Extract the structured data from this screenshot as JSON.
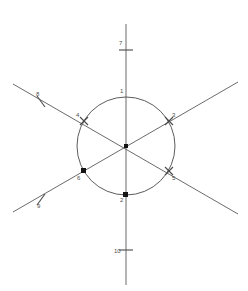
{
  "figure": {
    "kind": "geometry-diagram",
    "background_color": "#ffffff",
    "stroke_color": "#5a5a5a",
    "marker_color": "#141414",
    "label_color": "#4f4f4f",
    "width": 248,
    "height": 291,
    "circle": {
      "center_x": 126,
      "center_y": 146,
      "radius": 49
    },
    "center_point": {
      "label": "",
      "x": 126,
      "y": 146,
      "marker": "dot"
    },
    "lines": [
      {
        "name": "vertical-line",
        "x1": 126,
        "y1": 24,
        "x2": 126,
        "y2": 285
      },
      {
        "name": "diagonal-line-up-right",
        "x1": 13,
        "y1": 212,
        "x2": 238,
        "y2": 82
      },
      {
        "name": "diagonal-line-down-right",
        "x1": 13,
        "y1": 84,
        "x2": 238,
        "y2": 214
      }
    ],
    "points": [
      {
        "label": "1",
        "x": 126,
        "y": 97,
        "label_x": 120,
        "label_y": 90,
        "marker": "none"
      },
      {
        "label": "2",
        "x": 126,
        "y": 195,
        "label_x": 120,
        "label_y": 198,
        "marker": "square"
      },
      {
        "label": "3",
        "x": 169,
        "y": 121,
        "label_x": 172,
        "label_y": 113,
        "marker": "cross"
      },
      {
        "label": "4",
        "x": 84,
        "y": 121,
        "label_x": 76,
        "label_y": 113,
        "marker": "cross"
      },
      {
        "label": "5",
        "x": 169,
        "y": 171,
        "label_x": 172,
        "label_y": 176,
        "marker": "cross"
      },
      {
        "label": "6",
        "x": 84,
        "y": 171,
        "label_x": 77,
        "label_y": 176,
        "marker": "square"
      }
    ],
    "ticks": [
      {
        "label": "7",
        "x": 126,
        "y": 50,
        "label_x": 119,
        "label_y": 41,
        "orientation": "horizontal"
      },
      {
        "label": "8",
        "x": 41,
        "y": 101,
        "label_x": 36,
        "label_y": 92,
        "orientation": "perpendicular-up-right"
      },
      {
        "label": "9",
        "x": 41,
        "y": 200,
        "label_x": 37,
        "label_y": 203,
        "orientation": "perpendicular-down-right"
      },
      {
        "label": "10",
        "x": 126,
        "y": 250,
        "label_x": 114,
        "label_y": 249,
        "orientation": "horizontal"
      }
    ]
  }
}
